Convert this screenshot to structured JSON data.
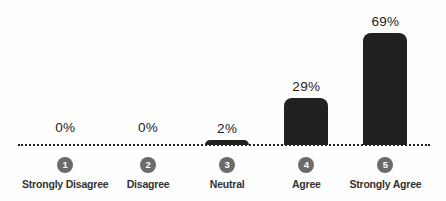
{
  "chart_data": {
    "type": "bar",
    "title": "",
    "categories": [
      "Strongly Disagree",
      "Disagree",
      "Neutral",
      "Agree",
      "Strongly Agree"
    ],
    "category_numbers": [
      "1",
      "2",
      "3",
      "4",
      "5"
    ],
    "values": [
      0,
      0,
      2,
      29,
      69
    ],
    "value_labels": [
      "0%",
      "0%",
      "2%",
      "29%",
      "69%"
    ],
    "unit": "%",
    "xlabel": "",
    "ylabel": "",
    "ylim": [
      0,
      100
    ],
    "grid": false,
    "legend": "none",
    "axis_style": "dotted-baseline",
    "colors": {
      "bar": "#212121",
      "circle_badge": "#6b6b6b",
      "circle_badge_text": "#ffffff",
      "category_label": "#333333",
      "value_label": "#222222",
      "baseline": "#222222",
      "background": "#fefefe"
    }
  }
}
